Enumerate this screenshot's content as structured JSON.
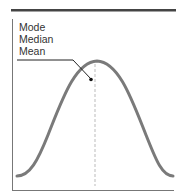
{
  "diagram": {
    "type": "normal-distribution",
    "labels": [
      "Mode",
      "Median",
      "Mean"
    ],
    "colors": {
      "curve": "#777777",
      "axis": "#666666",
      "top_bar": "#444444",
      "dashed_line": "#bbbbbb",
      "leader": "#222222",
      "text": "#333333"
    },
    "annotation": "Mode, Median and Mean coincide at the peak of the symmetric curve"
  }
}
